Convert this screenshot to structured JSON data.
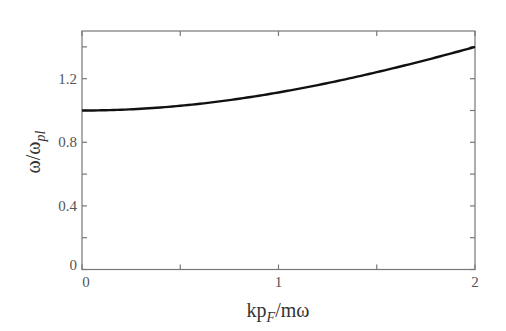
{
  "chart_data": {
    "type": "line",
    "title": "",
    "xlabel": "kp_F/mω",
    "xlabel_parts": {
      "main": "kp",
      "sub": "F",
      "rest": "/mω"
    },
    "ylabel": "ω/ω_pl",
    "ylabel_parts": {
      "main": "ω/ω",
      "sub": "pl"
    },
    "xlim": [
      0,
      2
    ],
    "ylim": [
      0,
      1.5
    ],
    "xticks_labeled": [
      0,
      1,
      2
    ],
    "xticks_minor": [
      0.5,
      1.5
    ],
    "yticks_labeled": [
      0,
      0.4,
      0.8,
      1.2
    ],
    "yticks_minor": [
      0.2,
      0.6,
      1.0,
      1.4
    ],
    "xtick_labels": [
      "0",
      "1",
      "2"
    ],
    "ytick_labels": [
      "0",
      "0.4",
      "0.8",
      "1.2"
    ],
    "grid": false,
    "legend": null,
    "series": [
      {
        "name": "dispersion",
        "color": "#111111",
        "x": [
          0,
          0.25,
          0.5,
          0.75,
          1.0,
          1.25,
          1.5,
          1.75,
          2.0
        ],
        "y": [
          1.0,
          1.007,
          1.03,
          1.065,
          1.114,
          1.172,
          1.238,
          1.31,
          1.4
        ]
      }
    ]
  }
}
